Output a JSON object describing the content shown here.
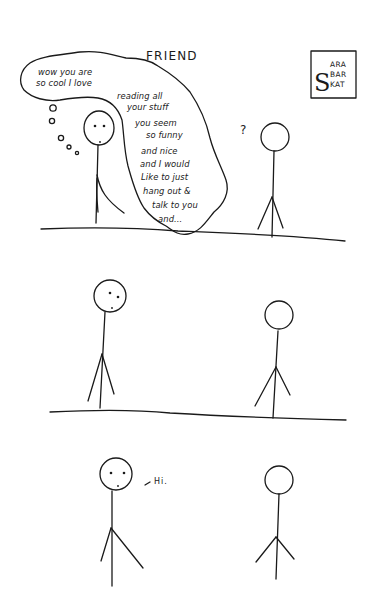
{
  "comic": {
    "title": "FRIEND",
    "signature": {
      "initial": "S",
      "lines": [
        "ARA",
        "BAR",
        "KAT"
      ]
    },
    "panels": [
      {
        "index": 1,
        "thought_bubble_lines": [
          "wow you are",
          "so cool I love",
          "reading all",
          "your stuff",
          "you seem",
          "so funny",
          "and nice",
          "and I would",
          "Like to just",
          "hang out &",
          "talk to you",
          "and..."
        ],
        "other_figure_text": "?"
      },
      {
        "index": 2
      },
      {
        "index": 3,
        "speech": "Hi."
      }
    ]
  }
}
